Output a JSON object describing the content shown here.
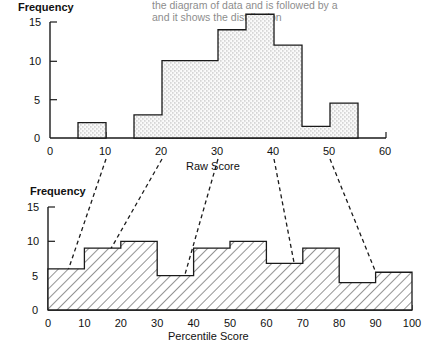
{
  "figure": {
    "title": "",
    "bleed_text": [
      {
        "text": "the diagram of data and is followed by a",
        "x": 150,
        "y": 8
      },
      {
        "text": "and it shows the distribution",
        "x": 150,
        "y": 20
      }
    ]
  },
  "chart_data": [
    {
      "id": "raw-score-histogram",
      "type": "bar",
      "title": "",
      "xlabel": "Raw Score",
      "ylabel": "Frequency",
      "xlim": [
        0,
        60
      ],
      "ylim": [
        0,
        15
      ],
      "xticks": [
        0,
        10,
        20,
        30,
        40,
        50,
        60
      ],
      "yticks": [
        0,
        5,
        10,
        15
      ],
      "grid": false,
      "legend": "none",
      "bin_width": 5,
      "bin_starts": [
        5,
        15,
        20,
        25,
        30,
        35,
        40,
        45,
        50
      ],
      "bin_edges": [
        "5-10",
        "15-20",
        "20-25",
        "25-30",
        "30-35",
        "35-40",
        "40-45",
        "45-50",
        "50-55"
      ],
      "values": [
        2,
        3,
        10,
        10,
        14,
        16,
        12,
        1.5,
        4.5
      ],
      "fill_style": "stipple"
    },
    {
      "id": "percentile-score-histogram",
      "type": "bar",
      "title": "",
      "xlabel": "Percentile Score",
      "ylabel": "Frequency",
      "xlim": [
        0,
        100
      ],
      "ylim": [
        0,
        15
      ],
      "xticks": [
        0,
        10,
        20,
        30,
        40,
        50,
        60,
        70,
        80,
        90,
        100
      ],
      "yticks": [
        0,
        5,
        10,
        15
      ],
      "grid": false,
      "legend": "none",
      "bin_width": 10,
      "bin_starts": [
        0,
        10,
        20,
        30,
        40,
        50,
        60,
        70,
        80,
        90
      ],
      "bin_edges": [
        "0-10",
        "10-20",
        "20-30",
        "30-40",
        "40-50",
        "50-60",
        "60-70",
        "70-80",
        "80-90",
        "90-100"
      ],
      "values": [
        6,
        9,
        10,
        5,
        9,
        10,
        6.8,
        9,
        4,
        5.5
      ],
      "fill_style": "hatch"
    }
  ],
  "connectors": {
    "description": "dashed lines mapping raw score marks to percentile score marks",
    "mappings": [
      {
        "raw": 10,
        "percentile": 2
      },
      {
        "raw": 20,
        "percentile": 8
      },
      {
        "raw": 30,
        "percentile": 35
      },
      {
        "raw": 40,
        "percentile": 70
      },
      {
        "raw": 50,
        "percentile": 94
      }
    ]
  },
  "labels": {
    "top_y_axis_title": "Frequency",
    "top_x_axis_title": "Raw Score",
    "bottom_y_axis_title": "Frequency",
    "bottom_x_axis_title": "Percentile Score",
    "top_xticks": [
      "0",
      "10",
      "20",
      "30",
      "40",
      "50",
      "60"
    ],
    "top_yticks": [
      "0",
      "5",
      "10",
      "15"
    ],
    "bottom_xticks": [
      "0",
      "10",
      "20",
      "30",
      "40",
      "50",
      "60",
      "70",
      "80",
      "90",
      "100"
    ],
    "bottom_yticks": [
      "0",
      "5",
      "10",
      "15"
    ]
  }
}
